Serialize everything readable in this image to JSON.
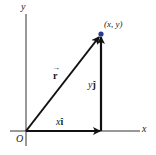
{
  "diagram": {
    "axes": {
      "x_label": "x",
      "y_label": "y",
      "origin_label": "O"
    },
    "point": {
      "label": "(x, y)",
      "color": "#2b3a8c"
    },
    "vectors": {
      "r": {
        "label": "r",
        "accent": "→"
      },
      "xi": {
        "coef": "x",
        "unit": "î"
      },
      "yj": {
        "coef": "y",
        "unit": "ĵ"
      }
    },
    "colors": {
      "line": "#111111",
      "point": "#2b3a8c"
    }
  }
}
